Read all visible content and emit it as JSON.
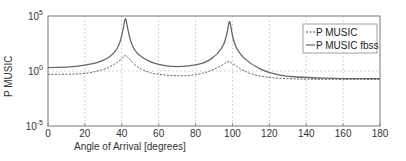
{
  "chart_data": {
    "type": "line",
    "title": "",
    "xlabel": "Angle of Arrival [degrees]",
    "ylabel": "P MUSIC",
    "xlim": [
      0,
      180
    ],
    "ylim_log10": [
      -5,
      5
    ],
    "yscale": "log",
    "grid": true,
    "legend_position": "upper right",
    "xticks": [
      "0",
      "20",
      "40",
      "60",
      "80",
      "100",
      "120",
      "140",
      "160",
      "180"
    ],
    "yticks": [
      {
        "base": "10",
        "exp": "5",
        "log": 5
      },
      {
        "base": "10",
        "exp": "0",
        "log": 0
      },
      {
        "base": "10",
        "exp": "-5",
        "log": -5
      }
    ],
    "series": [
      {
        "name": "P MUSIC",
        "style": "dashed",
        "color": "#555555",
        "x": [
          0,
          10,
          20,
          30,
          36,
          40,
          42,
          44,
          48,
          55,
          65,
          75,
          85,
          92,
          96,
          98,
          100,
          104,
          110,
          120,
          130,
          140,
          160,
          180
        ],
        "log10": [
          -0.3,
          -0.3,
          -0.25,
          0.1,
          0.6,
          1.1,
          1.5,
          1.1,
          0.4,
          -0.2,
          -0.4,
          -0.45,
          -0.2,
          0.3,
          0.7,
          0.9,
          0.7,
          0.2,
          -0.3,
          -0.6,
          -0.7,
          -0.75,
          -0.75,
          -0.75
        ]
      },
      {
        "name": "P MUSIC fbss",
        "style": "solid",
        "color": "#666666",
        "x": [
          0,
          10,
          20,
          30,
          36,
          39,
          41,
          42,
          43,
          45,
          48,
          55,
          65,
          75,
          85,
          92,
          96,
          97.5,
          98.5,
          100,
          103,
          110,
          120,
          130,
          140,
          160,
          180
        ],
        "log10": [
          0.3,
          0.35,
          0.5,
          0.9,
          1.6,
          2.5,
          4.0,
          5.0,
          4.0,
          2.5,
          1.6,
          0.8,
          0.4,
          0.4,
          0.7,
          1.5,
          2.6,
          3.8,
          4.8,
          3.0,
          1.7,
          0.6,
          -0.2,
          -0.5,
          -0.6,
          -0.7,
          -0.7
        ]
      }
    ]
  },
  "legend": {
    "items": [
      {
        "label": "P MUSIC",
        "style": "dashed"
      },
      {
        "label": "P MUSIC fbss",
        "style": "solid"
      }
    ]
  },
  "axes": {
    "xlabel": "Angle of Arrival [degrees]",
    "ylabel": "P MUSIC"
  }
}
